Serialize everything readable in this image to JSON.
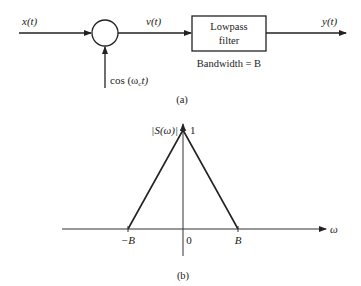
{
  "figure_a": {
    "input_label": "x(t)",
    "carrier_label": "cos (ω",
    "carrier_subscript": "c",
    "carrier_suffix": "t)",
    "product_label": "v(t)",
    "filter_label_line1": "Lowpass",
    "filter_label_line2": "filter",
    "filter_caption": "Bandwidth = B",
    "output_label": "y(t)",
    "caption": "(a)"
  },
  "figure_b": {
    "caption": "(b)",
    "chart_data": {
      "type": "line",
      "title": "",
      "ylabel": "|S(ω)|",
      "xlabel": "ω",
      "x_ticks": [
        "−B",
        "0",
        "B"
      ],
      "y_ticks": [
        "1"
      ],
      "series": [
        {
          "name": "|S(ω)|",
          "x": [
            -1,
            0,
            1
          ],
          "y": [
            0,
            1,
            0
          ],
          "x_units": "B"
        }
      ],
      "xlim": [
        -1.8,
        2.0
      ],
      "ylim": [
        0,
        1.3
      ],
      "grid": false
    }
  }
}
